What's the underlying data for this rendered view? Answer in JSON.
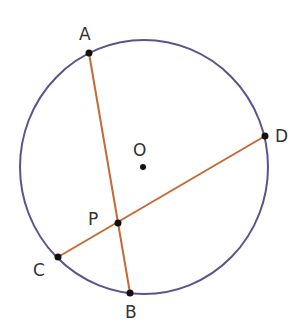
{
  "diagram": {
    "colors": {
      "circle": "#5b5290",
      "chord": "#c46a32",
      "point": "#111111",
      "label": "#333333"
    },
    "circle": {
      "center_label": "O",
      "cx": 144,
      "cy": 167,
      "rx": 124,
      "ry": 127
    },
    "points": {
      "A": {
        "label": "A",
        "x": 89,
        "y": 53
      },
      "B": {
        "label": "B",
        "x": 130,
        "y": 293
      },
      "C": {
        "label": "C",
        "x": 58,
        "y": 257
      },
      "D": {
        "label": "D",
        "x": 265,
        "y": 136
      },
      "P": {
        "label": "P",
        "x": 118,
        "y": 223
      },
      "O": {
        "label": "O",
        "x": 143,
        "y": 167
      }
    },
    "chords": [
      {
        "name": "AB",
        "from": "A",
        "to": "B"
      },
      {
        "name": "CD",
        "from": "C",
        "to": "D"
      }
    ]
  }
}
